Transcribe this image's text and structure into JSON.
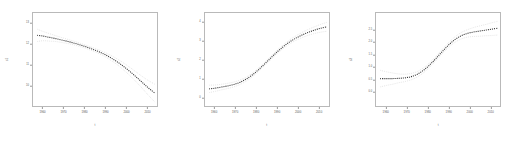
{
  "figure": {
    "background": "#ffffff",
    "frame_color": "#b9b9b9",
    "line_color": "#3a3a3a",
    "band_color": "#d8d8d8"
  },
  "chart_data": [
    {
      "type": "line",
      "title": "",
      "xlabel": "t",
      "ylabel": "s1",
      "xlim": [
        1955,
        2015
      ],
      "ylim": [
        9.0,
        13.5
      ],
      "grid": false,
      "legend": null,
      "xticks": [
        1960,
        1970,
        1980,
        1990,
        2000,
        2010
      ],
      "xtick_labels": [
        "1960",
        "1970",
        "1980",
        "1990",
        "2000",
        "2010"
      ],
      "yticks": [
        10.0,
        11.0,
        12.0,
        13.0
      ],
      "ytick_labels": [
        "10",
        "11",
        "12",
        "13"
      ],
      "x": [
        1957,
        1960,
        1963,
        1966,
        1969,
        1972,
        1975,
        1978,
        1981,
        1984,
        1987,
        1990,
        1993,
        1996,
        1999,
        2002,
        2005,
        2008,
        2011,
        2014
      ],
      "values": [
        12.42,
        12.38,
        12.32,
        12.26,
        12.19,
        12.12,
        12.04,
        11.95,
        11.85,
        11.74,
        11.62,
        11.48,
        11.31,
        11.12,
        10.9,
        10.66,
        10.4,
        10.13,
        9.86,
        9.62
      ],
      "band_upper": [
        12.72,
        12.6,
        12.5,
        12.4,
        12.31,
        12.22,
        12.13,
        12.03,
        11.93,
        11.82,
        11.71,
        11.58,
        11.43,
        11.26,
        11.07,
        10.86,
        10.64,
        10.42,
        10.22,
        10.05
      ],
      "band_lower": [
        12.12,
        12.16,
        12.14,
        12.12,
        12.07,
        12.02,
        11.95,
        11.87,
        11.77,
        11.66,
        11.53,
        11.38,
        11.19,
        10.98,
        10.73,
        10.46,
        10.16,
        9.84,
        9.5,
        9.19
      ]
    },
    {
      "type": "line",
      "title": "",
      "xlabel": "t",
      "ylabel": "s2",
      "xlim": [
        1955,
        2015
      ],
      "ylim": [
        -0.5,
        4.5
      ],
      "grid": false,
      "legend": null,
      "xticks": [
        1960,
        1970,
        1980,
        1990,
        2000,
        2010
      ],
      "xtick_labels": [
        "1960",
        "1970",
        "1980",
        "1990",
        "2000",
        "2010"
      ],
      "yticks": [
        0,
        1,
        2,
        3,
        4
      ],
      "ytick_labels": [
        "0",
        "1",
        "2",
        "3",
        "4"
      ],
      "x": [
        1957,
        1960,
        1963,
        1966,
        1969,
        1972,
        1975,
        1978,
        1981,
        1984,
        1987,
        1990,
        1993,
        1996,
        1999,
        2002,
        2005,
        2008,
        2011,
        2014
      ],
      "values": [
        0.42,
        0.46,
        0.52,
        0.58,
        0.66,
        0.78,
        0.95,
        1.18,
        1.46,
        1.78,
        2.1,
        2.42,
        2.7,
        2.95,
        3.15,
        3.32,
        3.46,
        3.58,
        3.68,
        3.76
      ],
      "band_upper": [
        0.62,
        0.63,
        0.67,
        0.72,
        0.79,
        0.9,
        1.06,
        1.28,
        1.55,
        1.87,
        2.19,
        2.51,
        2.8,
        3.06,
        3.27,
        3.46,
        3.62,
        3.76,
        3.89,
        4.0
      ],
      "band_lower": [
        0.22,
        0.29,
        0.37,
        0.44,
        0.53,
        0.66,
        0.84,
        1.08,
        1.37,
        1.69,
        2.01,
        2.33,
        2.6,
        2.84,
        3.03,
        3.18,
        3.3,
        3.4,
        3.47,
        3.52
      ]
    },
    {
      "type": "line",
      "title": "",
      "xlabel": "t",
      "ylabel": "s3",
      "xlim": [
        1955,
        2015
      ],
      "ylim": [
        -0.6,
        3.2
      ],
      "grid": false,
      "legend": null,
      "xticks": [
        1960,
        1970,
        1980,
        1990,
        2000,
        2010
      ],
      "xtick_labels": [
        "1960",
        "1970",
        "1980",
        "1990",
        "2000",
        "2010"
      ],
      "yticks": [
        0.0,
        0.5,
        1.0,
        1.5,
        2.0,
        2.5
      ],
      "ytick_labels": [
        "0.0",
        "0.5",
        "1.0",
        "1.5",
        "2.0",
        "2.5"
      ],
      "x": [
        1957,
        1960,
        1963,
        1966,
        1969,
        1972,
        1975,
        1978,
        1981,
        1984,
        1987,
        1990,
        1993,
        1996,
        1999,
        2002,
        2005,
        2008,
        2011,
        2014
      ],
      "values": [
        0.52,
        0.52,
        0.52,
        0.53,
        0.55,
        0.6,
        0.7,
        0.86,
        1.08,
        1.34,
        1.62,
        1.88,
        2.1,
        2.26,
        2.36,
        2.42,
        2.46,
        2.5,
        2.54,
        2.58
      ],
      "band_upper": [
        0.86,
        0.8,
        0.75,
        0.71,
        0.7,
        0.73,
        0.81,
        0.96,
        1.17,
        1.43,
        1.71,
        1.98,
        2.21,
        2.39,
        2.51,
        2.6,
        2.67,
        2.73,
        2.8,
        2.86
      ],
      "band_lower": [
        0.18,
        0.24,
        0.29,
        0.35,
        0.4,
        0.47,
        0.59,
        0.76,
        0.99,
        1.25,
        1.53,
        1.78,
        1.99,
        2.13,
        2.21,
        2.24,
        2.25,
        2.27,
        2.28,
        2.3
      ]
    }
  ]
}
